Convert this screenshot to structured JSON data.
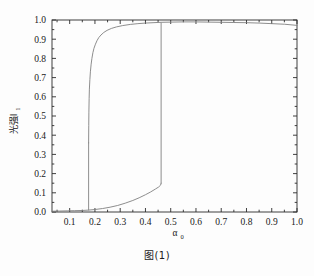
{
  "figure": {
    "caption": "图(1)"
  },
  "chart_data": {
    "type": "line",
    "title": "",
    "subtitle": "",
    "xlabel": "α",
    "xlabel_sub": "0",
    "ylabel": "光强I",
    "ylabel_sub": "1",
    "xlim": [
      0.03,
      1.0
    ],
    "ylim": [
      0.0,
      1.0
    ],
    "grid": false,
    "legend": "none",
    "xticks": [
      0.1,
      0.2,
      0.3,
      0.4,
      0.5,
      0.6,
      0.7,
      0.8,
      0.9,
      1.0
    ],
    "xticklabels": [
      "0.1",
      "0.2",
      "0.3",
      "0.4",
      "0.5",
      "0.6",
      "0.7",
      "0.8",
      "0.9",
      "1.0"
    ],
    "yticks": [
      0.0,
      0.1,
      0.2,
      0.3,
      0.4,
      0.5,
      0.6,
      0.7,
      0.8,
      0.9,
      1.0
    ],
    "yticklabels": [
      "0.0",
      "0.1",
      "0.2",
      "0.3",
      "0.4",
      "0.5",
      "0.6",
      "0.7",
      "0.8",
      "0.9",
      "1.0"
    ],
    "minor_xticks": [
      0.05,
      0.15,
      0.25,
      0.35,
      0.45,
      0.55,
      0.65,
      0.75,
      0.85,
      0.95
    ],
    "minor_yticks": [
      0.05,
      0.15,
      0.25,
      0.35,
      0.45,
      0.55,
      0.65,
      0.75,
      0.85,
      0.95
    ],
    "line_color": "#808080",
    "line_width": 0.9,
    "switch_up_x": 0.462,
    "switch_down_x": 0.175,
    "series": [
      {
        "name": "lower-branch",
        "comment": "ascending branch: low transmission state",
        "points": [
          [
            0.03,
            0.004
          ],
          [
            0.06,
            0.005
          ],
          [
            0.09,
            0.006
          ],
          [
            0.12,
            0.007
          ],
          [
            0.15,
            0.008
          ],
          [
            0.175,
            0.01
          ],
          [
            0.2,
            0.013
          ],
          [
            0.23,
            0.018
          ],
          [
            0.26,
            0.025
          ],
          [
            0.29,
            0.034
          ],
          [
            0.32,
            0.046
          ],
          [
            0.35,
            0.06
          ],
          [
            0.375,
            0.074
          ],
          [
            0.4,
            0.09
          ],
          [
            0.42,
            0.104
          ],
          [
            0.44,
            0.12
          ],
          [
            0.452,
            0.13
          ],
          [
            0.46,
            0.14
          ],
          [
            0.462,
            0.15
          ]
        ]
      },
      {
        "name": "up-switch",
        "comment": "vertical jump from low to high state at alpha0 = 0.462",
        "points": [
          [
            0.462,
            0.15
          ],
          [
            0.462,
            0.985
          ]
        ]
      },
      {
        "name": "upper-branch",
        "comment": "descending branch: high transmission state",
        "points": [
          [
            1.0,
            0.972
          ],
          [
            0.95,
            0.978
          ],
          [
            0.9,
            0.981
          ],
          [
            0.85,
            0.984
          ],
          [
            0.8,
            0.986
          ],
          [
            0.75,
            0.987
          ],
          [
            0.7,
            0.988
          ],
          [
            0.65,
            0.989
          ],
          [
            0.6,
            0.99
          ],
          [
            0.55,
            0.99
          ],
          [
            0.5,
            0.989
          ],
          [
            0.462,
            0.988
          ],
          [
            0.43,
            0.986
          ],
          [
            0.4,
            0.984
          ],
          [
            0.37,
            0.981
          ],
          [
            0.34,
            0.977
          ],
          [
            0.31,
            0.971
          ],
          [
            0.285,
            0.964
          ],
          [
            0.265,
            0.956
          ],
          [
            0.248,
            0.946
          ],
          [
            0.235,
            0.935
          ],
          [
            0.224,
            0.922
          ],
          [
            0.215,
            0.908
          ],
          [
            0.208,
            0.892
          ],
          [
            0.202,
            0.874
          ],
          [
            0.196,
            0.852
          ],
          [
            0.192,
            0.83
          ],
          [
            0.188,
            0.8
          ],
          [
            0.185,
            0.77
          ],
          [
            0.182,
            0.73
          ],
          [
            0.18,
            0.69
          ],
          [
            0.178,
            0.64
          ],
          [
            0.177,
            0.59
          ],
          [
            0.176,
            0.52
          ],
          [
            0.1755,
            0.45
          ],
          [
            0.175,
            0.36
          ]
        ]
      },
      {
        "name": "down-switch",
        "comment": "vertical drop from high to low state at alpha0 = 0.175",
        "points": [
          [
            0.175,
            0.36
          ],
          [
            0.175,
            0.01
          ]
        ]
      }
    ]
  }
}
